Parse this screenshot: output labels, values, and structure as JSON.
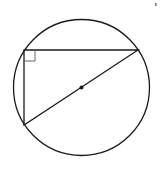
{
  "diagram": {
    "type": "geometry",
    "canvas": {
      "width": 162,
      "height": 169,
      "background": "#ffffff"
    },
    "stroke_color": "#1a1a1a",
    "circle": {
      "cx": 81.5,
      "cy": 87.5,
      "r": 68
    },
    "center_point": {
      "x": 81.5,
      "y": 87.5,
      "r": 2
    },
    "triangle": {
      "vertices": [
        {
          "name": "right-angle-vertex",
          "x": 24,
          "y": 50
        },
        {
          "name": "top-right-vertex",
          "x": 138,
          "y": 50
        },
        {
          "name": "bottom-left-vertex",
          "x": 24,
          "y": 125
        }
      ]
    },
    "right_angle_marker": {
      "x": 24,
      "y": 50,
      "size": 11
    },
    "corner_mark": {
      "x": 155,
      "y": 3
    }
  }
}
